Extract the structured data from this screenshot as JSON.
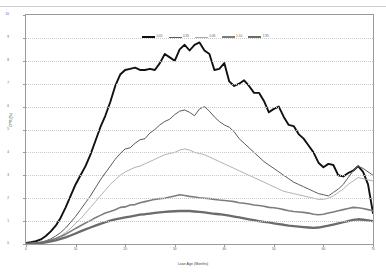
{
  "axes": {
    "ylabel": "CPR (%)",
    "xlabel": "Loan Age (Months)",
    "yticks": [
      "10",
      "9",
      "8",
      "7",
      "6",
      "5",
      "4",
      "3",
      "2",
      "1",
      "0"
    ],
    "xticks": [
      "0",
      "10",
      "20",
      "30",
      "40",
      "50",
      "60",
      "70"
    ]
  },
  "legend": [
    {
      "label": "0.05",
      "color": "#111111",
      "width": 1.9
    },
    {
      "label": "0.35",
      "color": "#5a5a5a",
      "width": 1.0
    },
    {
      "label": "0.65",
      "color": "#a8a8a8",
      "width": 0.9
    },
    {
      "label": "1.10",
      "color": "#7d7d7d",
      "width": 1.6
    },
    {
      "label": "1.95",
      "color": "#6b6b6b",
      "width": 2.3
    }
  ],
  "chart_data": {
    "type": "line",
    "title": "",
    "xlabel": "Loan Age (Months)",
    "ylabel": "CPR (%)",
    "xlim": [
      0,
      70
    ],
    "ylim": [
      0,
      10
    ],
    "grid": true,
    "legend_position": "top-center",
    "x": [
      0,
      1,
      2,
      3,
      4,
      5,
      6,
      7,
      8,
      9,
      10,
      11,
      12,
      13,
      14,
      15,
      16,
      17,
      18,
      19,
      20,
      21,
      22,
      23,
      24,
      25,
      26,
      27,
      28,
      29,
      30,
      31,
      32,
      33,
      34,
      35,
      36,
      37,
      38,
      39,
      40,
      41,
      42,
      43,
      44,
      45,
      46,
      47,
      48,
      49,
      50,
      51,
      52,
      53,
      54,
      55,
      56,
      57,
      58,
      59,
      60,
      61,
      62,
      63,
      64,
      65,
      66,
      67,
      68,
      69,
      70
    ],
    "series": [
      {
        "name": "0.05",
        "color": "#111111",
        "values": [
          0.05,
          0.08,
          0.12,
          0.2,
          0.35,
          0.55,
          0.8,
          1.15,
          1.6,
          2.1,
          2.6,
          3.0,
          3.4,
          3.9,
          4.5,
          5.1,
          5.6,
          6.2,
          6.9,
          7.4,
          7.6,
          7.65,
          7.7,
          7.6,
          7.6,
          7.65,
          7.6,
          7.9,
          8.3,
          8.15,
          8.0,
          8.5,
          8.7,
          8.45,
          8.7,
          8.8,
          8.45,
          8.3,
          7.6,
          7.65,
          7.9,
          7.1,
          6.9,
          7.0,
          7.15,
          6.9,
          6.6,
          6.6,
          6.25,
          5.75,
          5.9,
          6.0,
          5.55,
          5.2,
          5.15,
          4.8,
          4.6,
          4.3,
          4.0,
          3.55,
          3.35,
          3.5,
          3.45,
          3.0,
          2.95,
          3.1,
          3.2,
          3.4,
          3.15,
          2.6,
          1.35
        ]
      },
      {
        "name": "0.35",
        "color": "#5a5a5a",
        "values": [
          0.02,
          0.03,
          0.05,
          0.08,
          0.14,
          0.22,
          0.35,
          0.5,
          0.7,
          0.95,
          1.2,
          1.5,
          1.8,
          2.1,
          2.45,
          2.8,
          3.1,
          3.4,
          3.7,
          3.95,
          4.15,
          4.2,
          4.4,
          4.55,
          4.6,
          4.85,
          5.0,
          5.2,
          5.35,
          5.45,
          5.65,
          5.8,
          5.85,
          5.75,
          5.6,
          5.9,
          6.0,
          5.8,
          5.55,
          5.35,
          5.2,
          5.1,
          4.9,
          4.6,
          4.4,
          4.2,
          4.0,
          3.8,
          3.6,
          3.45,
          3.3,
          3.15,
          3.0,
          2.85,
          2.7,
          2.6,
          2.5,
          2.4,
          2.3,
          2.2,
          2.15,
          2.1,
          2.25,
          2.4,
          2.6,
          2.9,
          3.2,
          3.4,
          3.3,
          3.15,
          3.0
        ]
      },
      {
        "name": "0.65",
        "color": "#a8a8a8",
        "values": [
          0.01,
          0.02,
          0.03,
          0.05,
          0.09,
          0.15,
          0.24,
          0.35,
          0.5,
          0.68,
          0.9,
          1.1,
          1.35,
          1.6,
          1.85,
          2.1,
          2.35,
          2.6,
          2.8,
          3.0,
          3.15,
          3.25,
          3.35,
          3.4,
          3.5,
          3.6,
          3.7,
          3.8,
          3.9,
          3.95,
          4.0,
          4.1,
          4.15,
          4.1,
          4.0,
          3.95,
          3.9,
          3.8,
          3.7,
          3.6,
          3.5,
          3.4,
          3.3,
          3.2,
          3.1,
          3.0,
          2.9,
          2.8,
          2.7,
          2.6,
          2.5,
          2.4,
          2.3,
          2.25,
          2.2,
          2.15,
          2.1,
          2.05,
          2.0,
          1.95,
          1.95,
          2.0,
          2.1,
          2.25,
          2.4,
          2.6,
          2.75,
          2.9,
          2.85,
          2.8,
          2.75
        ]
      },
      {
        "name": "1.10",
        "color": "#7d7d7d",
        "values": [
          0.01,
          0.02,
          0.04,
          0.07,
          0.11,
          0.17,
          0.24,
          0.33,
          0.43,
          0.55,
          0.68,
          0.8,
          0.92,
          1.02,
          1.15,
          1.25,
          1.35,
          1.42,
          1.5,
          1.6,
          1.62,
          1.7,
          1.72,
          1.8,
          1.85,
          1.9,
          1.95,
          1.98,
          2.0,
          2.05,
          2.1,
          2.15,
          2.12,
          2.08,
          2.05,
          2.02,
          2.0,
          1.98,
          1.95,
          1.92,
          1.9,
          1.88,
          1.85,
          1.8,
          1.78,
          1.75,
          1.7,
          1.68,
          1.65,
          1.6,
          1.58,
          1.55,
          1.5,
          1.45,
          1.42,
          1.4,
          1.38,
          1.35,
          1.3,
          1.28,
          1.3,
          1.35,
          1.4,
          1.45,
          1.5,
          1.55,
          1.6,
          1.58,
          1.55,
          1.5,
          1.45
        ]
      },
      {
        "name": "1.95",
        "color": "#6b6b6b",
        "values": [
          0.01,
          0.01,
          0.02,
          0.04,
          0.07,
          0.11,
          0.16,
          0.22,
          0.29,
          0.37,
          0.46,
          0.55,
          0.64,
          0.72,
          0.8,
          0.88,
          0.95,
          1.02,
          1.08,
          1.12,
          1.16,
          1.2,
          1.24,
          1.28,
          1.3,
          1.33,
          1.36,
          1.38,
          1.4,
          1.42,
          1.43,
          1.44,
          1.45,
          1.44,
          1.42,
          1.4,
          1.38,
          1.35,
          1.32,
          1.3,
          1.27,
          1.24,
          1.2,
          1.16,
          1.12,
          1.08,
          1.04,
          1.0,
          0.97,
          0.94,
          0.9,
          0.87,
          0.84,
          0.8,
          0.78,
          0.76,
          0.74,
          0.72,
          0.7,
          0.72,
          0.76,
          0.8,
          0.85,
          0.9,
          0.95,
          1.0,
          1.05,
          1.08,
          1.06,
          1.03,
          1.0
        ]
      }
    ]
  }
}
